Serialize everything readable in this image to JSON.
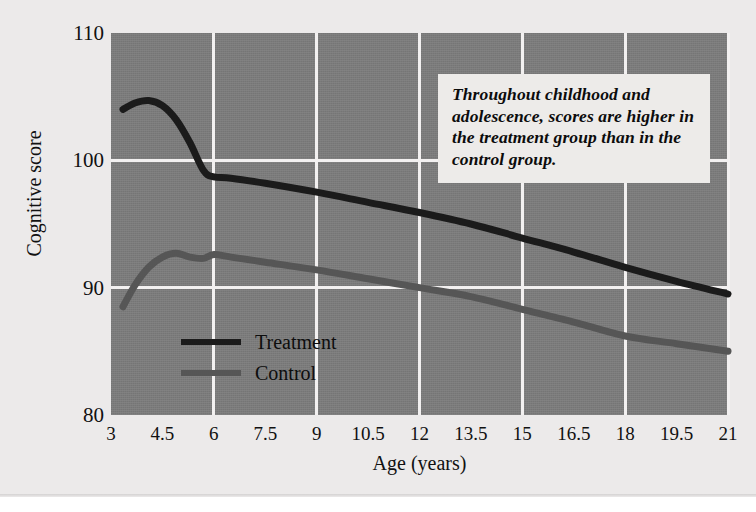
{
  "chart_data": {
    "type": "line",
    "title": "",
    "xlabel": "Age (years)",
    "ylabel": "Cognitive score",
    "xlim": [
      3,
      21
    ],
    "ylim": [
      80,
      110
    ],
    "yticks": [
      110,
      100,
      90,
      80
    ],
    "xticks": [
      "3",
      "4.5",
      "6",
      "7.5",
      "9",
      "10.5",
      "12",
      "13.5",
      "15",
      "16.5",
      "18",
      "19.5",
      "21"
    ],
    "xtick_values": [
      3,
      4.5,
      6,
      7.5,
      9,
      10.5,
      12,
      13.5,
      15,
      16.5,
      18,
      19.5,
      21
    ],
    "gridlines_x": [
      6,
      9,
      12,
      15,
      18,
      21
    ],
    "gridlines_y": [
      100,
      90
    ],
    "grid": true,
    "legend_position": "inside-lower-left",
    "plot_background": "#7b7b7b",
    "gridline_color": "#f2f0f0",
    "series": [
      {
        "name": "Treatment",
        "color": "#1b1b1b",
        "x": [
          3.35,
          3.7,
          4.1,
          4.5,
          4.9,
          5.3,
          5.7,
          6.0,
          6.5,
          7.5,
          9.0,
          10.5,
          12.0,
          13.5,
          15.0,
          16.5,
          18.0,
          19.5,
          21.0
        ],
        "values": [
          104.0,
          104.5,
          104.7,
          104.3,
          103.2,
          101.4,
          99.2,
          98.7,
          98.6,
          98.2,
          97.5,
          96.7,
          95.9,
          95.0,
          93.9,
          92.8,
          91.6,
          90.5,
          89.5
        ]
      },
      {
        "name": "Control",
        "color": "#565656",
        "x": [
          3.35,
          3.7,
          4.1,
          4.5,
          4.9,
          5.3,
          5.7,
          6.0,
          6.5,
          7.5,
          9.0,
          10.5,
          12.0,
          13.5,
          15.0,
          16.5,
          18.0,
          19.5,
          21.0
        ],
        "values": [
          88.5,
          90.2,
          91.6,
          92.4,
          92.7,
          92.4,
          92.3,
          92.6,
          92.4,
          92.0,
          91.4,
          90.7,
          90.0,
          89.3,
          88.3,
          87.3,
          86.2,
          85.6,
          85.0
        ]
      }
    ],
    "annotation": {
      "text": "Throughout childhood and adolescence, scores are higher in the treatment group than in the control group."
    }
  },
  "legend": {
    "items": [
      {
        "label": "Treatment",
        "color": "#1b1b1b"
      },
      {
        "label": "Control",
        "color": "#565656"
      }
    ]
  }
}
